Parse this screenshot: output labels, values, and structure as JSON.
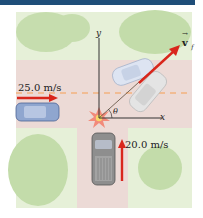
{
  "figure": {
    "type": "physics-diagram",
    "colors": {
      "header_bar": "#1f4e79",
      "grass": "#e3efd4",
      "tree": "#bcd9a3",
      "road": "#ecd9d6",
      "center_line": "#f0b27a",
      "arrow": "#d9261c",
      "axis": "#333333"
    },
    "labels": {
      "car1_speed": "25.0 m/s",
      "car2_speed": "20.0 m/s",
      "x_axis": "x",
      "y_axis": "y",
      "angle": "θ",
      "final_velocity": "v",
      "final_velocity_sub": "f"
    },
    "objects": [
      {
        "name": "car-eastbound",
        "color": "blue",
        "direction": "east"
      },
      {
        "name": "truck-northbound",
        "color": "gray",
        "direction": "north"
      },
      {
        "name": "wreck-position-1",
        "color": "light-blue"
      },
      {
        "name": "wreck-position-2",
        "color": "light-gray"
      }
    ]
  }
}
